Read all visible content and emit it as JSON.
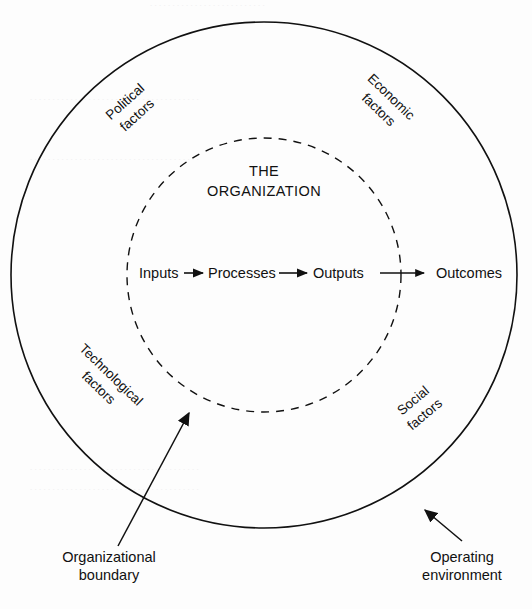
{
  "figure": {
    "type": "concentric-circle-systems-diagram",
    "background_color": "#fdfdfd",
    "line_color": "#111111",
    "text_color": "#111111"
  },
  "outer_circle": {
    "name": "operating environment boundary",
    "style": "solid",
    "center_x": 264,
    "center_y": 275,
    "radius": 253
  },
  "inner_circle": {
    "name": "organizational boundary",
    "style": "dashed",
    "center_x": 264,
    "center_y": 275,
    "radius": 137
  },
  "organization": {
    "line1": "THE",
    "line2": "ORGANIZATION"
  },
  "flow": {
    "nodes": [
      {
        "label": "Inputs",
        "inside_boundary": true
      },
      {
        "label": "Processes",
        "inside_boundary": true
      },
      {
        "label": "Outputs",
        "inside_boundary": true
      },
      {
        "label": "Outcomes",
        "inside_boundary": false
      }
    ],
    "arrows": 3
  },
  "environment_factors": [
    {
      "id": "political",
      "line1": "Political",
      "line2": "factors",
      "position": "top-left",
      "rotation_deg": -42
    },
    {
      "id": "economic",
      "line1": "Economic",
      "line2": "factors",
      "position": "top-right",
      "rotation_deg": 44
    },
    {
      "id": "technological",
      "line1": "Technological",
      "line2": "factors",
      "position": "bottom-left",
      "rotation_deg": 44
    },
    {
      "id": "social",
      "line1": "Social",
      "line2": "factors",
      "position": "bottom-right",
      "rotation_deg": -40
    }
  ],
  "callouts": [
    {
      "id": "organizational-boundary",
      "line1": "Organizational",
      "line2": "boundary",
      "points_to": "inner dashed circle",
      "arrow_from_x": 118,
      "arrow_from_y": 546,
      "arrow_to_x": 188,
      "arrow_to_y": 412
    },
    {
      "id": "operating-environment",
      "line1": "Operating",
      "line2": "environment",
      "points_to": "outer solid circle",
      "arrow_from_x": 462,
      "arrow_from_y": 541,
      "arrow_to_x": 424,
      "arrow_to_y": 510
    }
  ]
}
